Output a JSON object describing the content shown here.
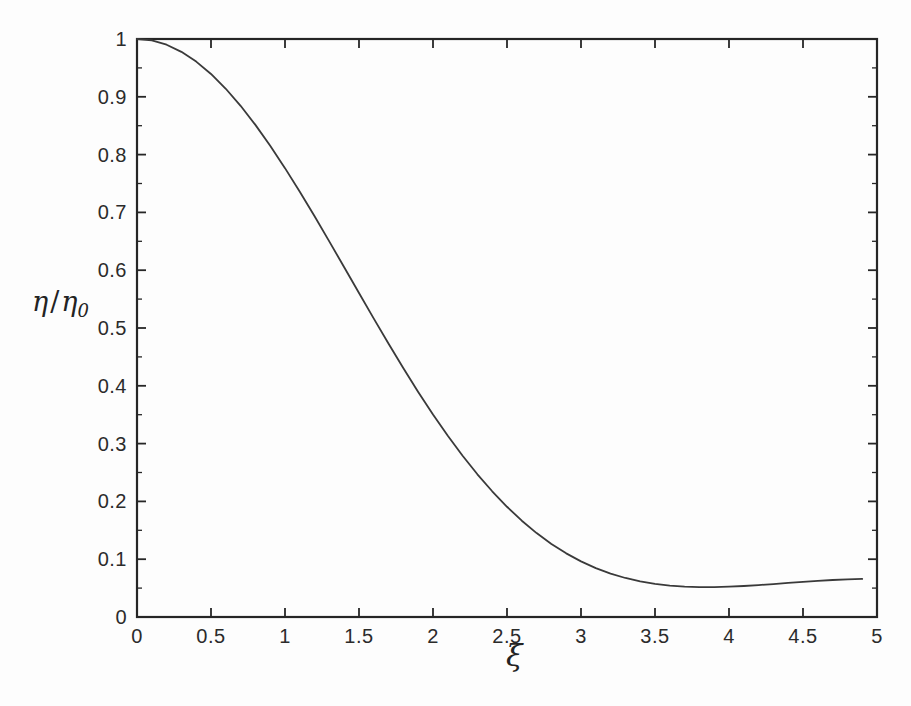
{
  "figure": {
    "background_color": "#fdfdfd",
    "line_color": "#3a3a3a",
    "axis_color": "#262626"
  },
  "axis_titles": {
    "y_eta": "η",
    "y_slash": "/",
    "y_eta0": "η",
    "y_sub": "0",
    "x": "ξ"
  },
  "chart_data": {
    "type": "line",
    "title": "",
    "subtitle": "",
    "xlabel": "ξ",
    "ylabel": "η / η₀",
    "xlim": [
      0,
      5
    ],
    "ylim": [
      0,
      1
    ],
    "grid": false,
    "legend": null,
    "xticks": [
      0,
      0.5,
      1,
      1.5,
      2,
      2.5,
      3,
      3.5,
      4,
      4.5,
      5
    ],
    "xtick_labels": [
      "0",
      "0.5",
      "1",
      "1.5",
      "2",
      "2.5",
      "3",
      "3.5",
      "4",
      "4.5",
      "5"
    ],
    "yticks": [
      0,
      0.1,
      0.2,
      0.3,
      0.4,
      0.5,
      0.6,
      0.7,
      0.8,
      0.9,
      1
    ],
    "ytick_labels": [
      "0",
      "0.1",
      "0.2",
      "0.3",
      "0.4",
      "0.5",
      "0.6",
      "0.7",
      "0.8",
      "0.9",
      "1"
    ],
    "y_minor_ticks": [
      0.05,
      0.15,
      0.25,
      0.35,
      0.45,
      0.55,
      0.65,
      0.75,
      0.85,
      0.95
    ],
    "series": [
      {
        "name": "Airy pattern [2J1(ξ)/ξ]^2",
        "x": [
          0,
          0.1,
          0.2,
          0.3,
          0.4,
          0.5,
          0.6,
          0.7,
          0.8,
          0.9,
          1.0,
          1.1,
          1.2,
          1.3,
          1.4,
          1.5,
          1.6,
          1.7,
          1.8,
          1.9,
          2.0,
          2.1,
          2.2,
          2.3,
          2.4,
          2.5,
          2.6,
          2.7,
          2.8,
          2.9,
          3.0,
          3.1,
          3.2,
          3.3,
          3.4,
          3.5,
          3.6,
          3.7,
          3.8,
          3.9,
          4.0,
          4.1,
          4.2,
          4.3,
          4.4,
          4.5,
          4.6,
          4.7,
          4.8,
          4.9
        ],
        "y": [
          1.0,
          0.9975,
          0.9901,
          0.9778,
          0.9609,
          0.9395,
          0.9139,
          0.8844,
          0.8514,
          0.8153,
          0.7766,
          0.7357,
          0.6932,
          0.6495,
          0.6051,
          0.5605,
          0.5162,
          0.4727,
          0.4303,
          0.3894,
          0.3504,
          0.3135,
          0.279,
          0.2469,
          0.2175,
          0.1907,
          0.1666,
          0.1452,
          0.1264,
          0.1101,
          0.0962,
          0.0846,
          0.0751,
          0.0675,
          0.0616,
          0.0573,
          0.0543,
          0.0525,
          0.0517,
          0.0517,
          0.0524,
          0.0536,
          0.0552,
          0.057,
          0.0589,
          0.0608,
          0.0625,
          0.064,
          0.0652,
          0.066
        ]
      }
    ],
    "annotations": [
      {
        "text": "central maximum at ξ = 0, η/η₀ = 1"
      },
      {
        "text": "first zero near ξ ≈ 2.75"
      },
      {
        "text": "secondary maximum near ξ ≈ 4.2, η/η₀ ≈ 0.115"
      }
    ],
    "curve_peak": {
      "x": 4.2,
      "y": 0.115
    },
    "curve_zero": {
      "x": 2.75,
      "y": 0.0
    },
    "curve_end": {
      "x": 4.92,
      "y": 0.075
    }
  }
}
